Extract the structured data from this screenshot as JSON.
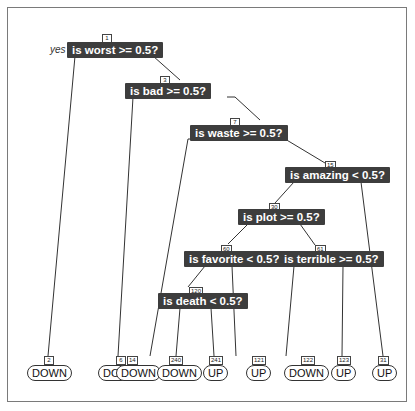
{
  "diagram": {
    "type": "decision-tree",
    "branch_labels": {
      "yes": "yes",
      "no": "no"
    },
    "split_nodes": [
      {
        "id": "1",
        "label": "is worst >= 0.5?"
      },
      {
        "id": "3",
        "label": "is bad >= 0.5?"
      },
      {
        "id": "7",
        "label": "is waste >= 0.5?"
      },
      {
        "id": "15",
        "label": "is amazing < 0.5?"
      },
      {
        "id": "30",
        "label": "is plot >= 0.5?"
      },
      {
        "id": "60",
        "label": "is favorite < 0.5?"
      },
      {
        "id": "61",
        "label": "is terrible >= 0.5?"
      },
      {
        "id": "120",
        "label": "is death < 0.5?"
      }
    ],
    "leaves": [
      {
        "id": "2",
        "label": "DOWN"
      },
      {
        "id": "6",
        "label": "DOWN"
      },
      {
        "id": "14",
        "label": "DOWN"
      },
      {
        "id": "240",
        "label": "DOWN"
      },
      {
        "id": "241",
        "label": "UP"
      },
      {
        "id": "121",
        "label": "UP"
      },
      {
        "id": "122",
        "label": "DOWN"
      },
      {
        "id": "123",
        "label": "UP"
      },
      {
        "id": "31",
        "label": "UP"
      }
    ],
    "colors": {
      "split_fill": "#3d3d3d",
      "split_text": "#ffffff",
      "edge": "#333333",
      "frame": "#7a7a7a"
    }
  }
}
